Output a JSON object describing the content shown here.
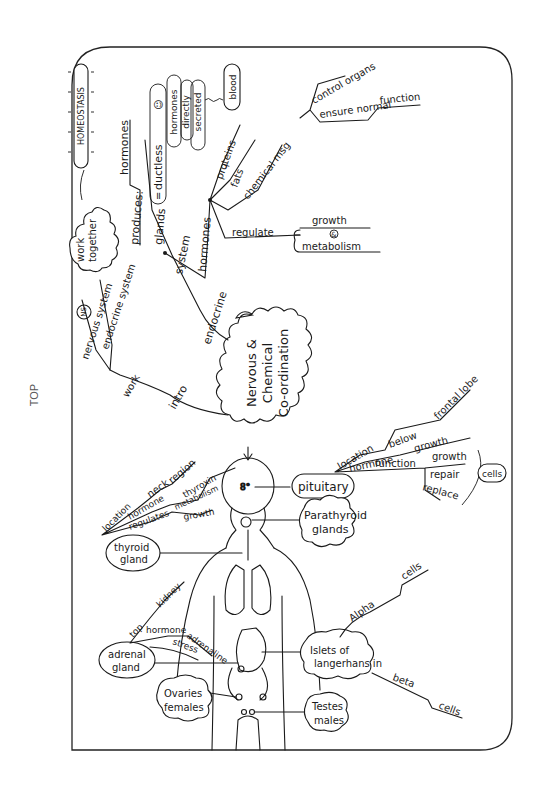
{
  "page": {
    "orientation_label": "TOP",
    "colors": {
      "ink": "#1a1a1a",
      "background": "#ffffff",
      "frame": "#222222"
    }
  },
  "central": {
    "lines": [
      "Nervous &",
      "Chemical",
      "Co-ordination"
    ]
  },
  "intro_branch": {
    "intro_label": "intro",
    "work_label": "work",
    "nervous_system": "nervous system",
    "ns_badge": "NS",
    "endocrine_system": "endocrine system",
    "es_badge": "ES",
    "work_together": [
      "work",
      "together"
    ],
    "homeostasis": "HOMEOSTASIS"
  },
  "endocrine_branch": {
    "root": "endocrine",
    "system": "system",
    "glands": "glands",
    "equals": "=",
    "ductless": "ductless",
    "smiley": "☺",
    "produces": "produces:",
    "hormones": "hormones",
    "secretion_bubble": [
      "hormones",
      "directly",
      "secreted"
    ],
    "blood": "blood",
    "hormones_node": "hormones",
    "proteins": "proteins",
    "plus": "+",
    "fats": "fats",
    "chemical_msg": "chemical msg",
    "control_organs": "control organs",
    "ensure_normal": "ensure normal",
    "function": "function",
    "regulate": "regulate",
    "growth": "growth",
    "and": "&",
    "metabolism": "metabolism"
  },
  "glands": {
    "pituitary": {
      "name": "pituitary",
      "location": "location",
      "below": "below",
      "frontal_lobe": "frontal lobe",
      "hormone": "hormone",
      "hormone_value": "growth",
      "function": "function",
      "functions": [
        "growth",
        "repair",
        "replace"
      ],
      "cells": "cells"
    },
    "parathyroid": {
      "name": [
        "Parathyroid",
        "glands"
      ]
    },
    "thyroid": {
      "name": [
        "thyroid",
        "gland"
      ],
      "location": "location",
      "neck": "neck",
      "region": "region",
      "hormone": "hormone",
      "hormone_value": "thyroxin",
      "regulates": "regulates",
      "metabolism": "metabolism",
      "growth": "growth"
    },
    "adrenal": {
      "name": [
        "adrenal",
        "gland"
      ],
      "top": "top",
      "kidney": "kidney",
      "hormone": "hormone",
      "hormone_value": "adrenaline",
      "stress": "stress"
    },
    "islets": {
      "name": [
        "Islets of",
        "langerhans in",
        "pancreas"
      ],
      "alpha": "Alpha",
      "alpha_cells": "cells",
      "beta": "beta",
      "beta_cells": "cells"
    },
    "ovaries": {
      "name": [
        "Ovaries",
        "females"
      ]
    },
    "testes": {
      "name": [
        "Testes",
        "males"
      ]
    }
  }
}
